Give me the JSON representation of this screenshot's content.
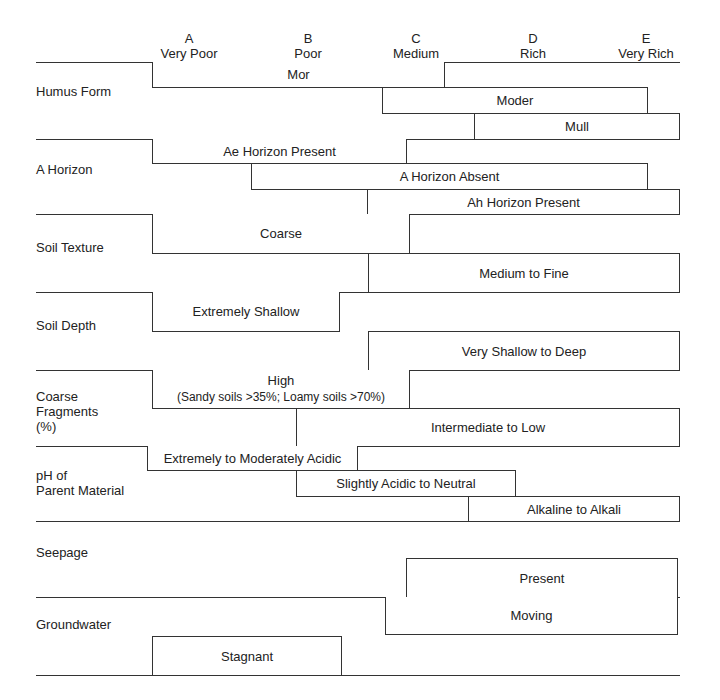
{
  "columns": [
    {
      "letter": "A",
      "label": "Very Poor"
    },
    {
      "letter": "B",
      "label": "Poor"
    },
    {
      "letter": "C",
      "label": "Medium"
    },
    {
      "letter": "D",
      "label": "Rich"
    },
    {
      "letter": "E",
      "label": "Very Rich"
    }
  ],
  "sections": [
    {
      "label": "Humus Form",
      "bars": [
        {
          "label": "Mor",
          "from": "A",
          "to": "C+"
        },
        {
          "label": "Moder",
          "from": "C-",
          "to": "E-"
        },
        {
          "label": "Mull",
          "from": "D-",
          "to": "E"
        }
      ]
    },
    {
      "label": "A Horizon",
      "bars": [
        {
          "label": "Ae Horizon Present",
          "from": "A",
          "to": "C"
        },
        {
          "label": "A Horizon Absent",
          "from": "B-",
          "to": "E-"
        },
        {
          "label": "Ah Horizon Present",
          "from": "C-",
          "to": "E"
        }
      ]
    },
    {
      "label": "Soil Texture",
      "bars": [
        {
          "label": "Coarse",
          "from": "A",
          "to": "C"
        },
        {
          "label": "Medium to Fine",
          "from": "C-",
          "to": "E"
        }
      ]
    },
    {
      "label": "Soil Depth",
      "bars": [
        {
          "label": "Extremely Shallow",
          "from": "A",
          "to": "B"
        },
        {
          "label": "Very Shallow to Deep",
          "from": "C-",
          "to": "E"
        }
      ]
    },
    {
      "label_lines": [
        "Coarse",
        "Fragments",
        "(%)"
      ],
      "bars": [
        {
          "label": "High",
          "sublabel": "(Sandy soils >35%; Loamy soils >70%)",
          "from": "A",
          "to": "C"
        },
        {
          "label": "Intermediate to Low",
          "from": "B",
          "to": "E"
        }
      ]
    },
    {
      "label_lines": [
        "pH of",
        "Parent Material"
      ],
      "bars": [
        {
          "label": "Extremely to Moderately Acidic",
          "from": "A",
          "to": "B+"
        },
        {
          "label": "Slightly Acidic to Neutral",
          "from": "B",
          "to": "D-"
        },
        {
          "label": "Alkaline to Alkali",
          "from": "D-",
          "to": "E"
        }
      ]
    },
    {
      "label": "Seepage",
      "bars": [
        {
          "label": "Present",
          "from": "C",
          "to": "E"
        }
      ]
    },
    {
      "label": "Groundwater",
      "bars": [
        {
          "label": "Moving",
          "from": "C-",
          "to": "E"
        },
        {
          "label": "Stagnant",
          "from": "A",
          "to": "B"
        }
      ]
    }
  ]
}
